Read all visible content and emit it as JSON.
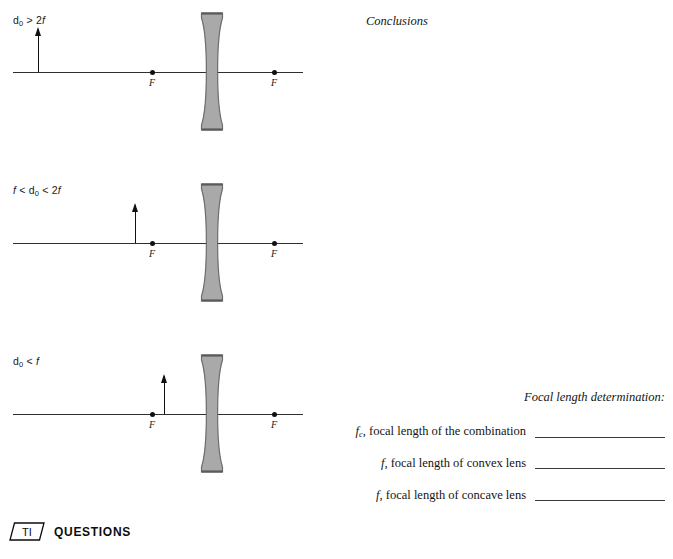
{
  "page": {
    "background": "#ffffff",
    "ink": "#111111"
  },
  "conclusions": {
    "heading": "Conclusions"
  },
  "diagrams": [
    {
      "id": "diagram-do-gt-2f",
      "label_html": "d<sub>0</sub> > 2<i>f</i>",
      "label_text": "d0 > 2f",
      "top": 0,
      "axis_y": 72,
      "axis_x1": 13,
      "axis_x2": 303,
      "lens_x": 199,
      "lens_top": 12,
      "lens_height": 119,
      "left_focus_x": 152,
      "right_focus_x": 274,
      "focus_label": "F",
      "arrow_x": 38,
      "arrow_height": 43
    },
    {
      "id": "diagram-f-lt-do-lt-2f",
      "label_html": "<i>f</i> < d<sub>0</sub> < 2<i>f</i>",
      "label_text": "f < d0 < 2f",
      "top": 170,
      "axis_y": 243,
      "axis_x1": 13,
      "axis_x2": 303,
      "lens_x": 199,
      "lens_top": 183,
      "lens_height": 119,
      "left_focus_x": 152,
      "right_focus_x": 274,
      "focus_label": "F",
      "arrow_x": 135,
      "arrow_height": 38
    },
    {
      "id": "diagram-do-lt-f",
      "label_html": "d<sub>0</sub> < <i>f</i>",
      "label_text": "d0 < f",
      "top": 340,
      "axis_y": 414,
      "axis_x1": 13,
      "axis_x2": 303,
      "lens_x": 199,
      "lens_top": 354,
      "lens_height": 119,
      "left_focus_x": 152,
      "right_focus_x": 274,
      "focus_label": "F",
      "arrow_x": 164,
      "arrow_height": 38
    }
  ],
  "focal_section": {
    "title": "Focal length determination:",
    "rows": [
      {
        "id": "fc-combination",
        "symbol_html": "<i>f</i><sub>c</sub>,",
        "text": " focal length of the combination",
        "value": "",
        "line_width": 130
      },
      {
        "id": "f-convex",
        "symbol_html": "<i>f</i>,",
        "text": " focal length of convex lens",
        "value": "",
        "line_width": 130
      },
      {
        "id": "f-concave",
        "symbol_html": "<i>f</i>,",
        "text": " focal length of concave lens",
        "value": "",
        "line_width": 130
      }
    ]
  },
  "footer": {
    "badge_text": "TI",
    "heading": "QUESTIONS"
  },
  "colors": {
    "lens_fill": "#a9a9a9",
    "lens_stroke": "#6d6d6d",
    "axis": "#2f2f2f",
    "dot": "#101010",
    "rule": "#3a3a3a"
  }
}
